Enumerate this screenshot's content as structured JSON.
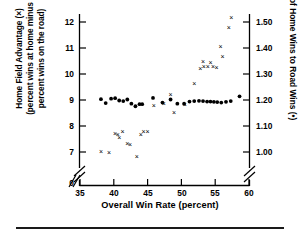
{
  "figure": {
    "background": "#ffffff",
    "ink": "#000000"
  },
  "axes": {
    "x": {
      "title": "Overall Win Rate (percent)",
      "ticks": [
        35,
        40,
        45,
        50,
        55,
        60
      ],
      "tick_labels": [
        "35",
        "40",
        "45",
        "50",
        "55",
        "60"
      ],
      "origin_label": "0",
      "range": [
        35,
        60
      ],
      "axis_break": true
    },
    "y_left": {
      "title_line1": "Home Field Advantage (×)",
      "title_line2": "(percent wins at home minus",
      "title_line3": "percent wins on the road)",
      "ticks": [
        7,
        8,
        9,
        10,
        11,
        12
      ],
      "tick_labels": [
        "7",
        "8",
        "9",
        "10",
        "11",
        "12"
      ],
      "origin_label": "0",
      "range": [
        7,
        12
      ],
      "axis_break": true,
      "marker": "x"
    },
    "y_right": {
      "title": "Ratio of Home Wins to Road Wins (•)",
      "ticks": [
        1.0,
        1.1,
        1.2,
        1.3,
        1.4,
        1.5
      ],
      "tick_labels": [
        "1.00",
        "1.10",
        "1.20",
        "1.30",
        "1.40",
        "1.50"
      ],
      "range": [
        1.0,
        1.5
      ],
      "axis_break": true,
      "marker": "•"
    }
  },
  "chart_data": {
    "type": "scatter",
    "title": "",
    "xlabel": "Overall Win Rate (percent)",
    "ylabel": "Home Field Advantage (x) (percent wins at home minus percent wins on the road)",
    "ylabel_right": "Ratio of Home Wins to Road Wins (•)",
    "xlim": [
      35,
      60
    ],
    "ylim_left": [
      7,
      12
    ],
    "ylim_right": [
      1.0,
      1.5
    ],
    "grid": false,
    "legend": "encoded in axis titles: x = Home Field Advantage, • = Ratio of Home Wins to Road Wins",
    "series": [
      {
        "name": "Home Field Advantage",
        "marker": "x",
        "axis": "left",
        "color": "#000000",
        "points": [
          {
            "x": 38.1,
            "y": 7.0
          },
          {
            "x": 39.3,
            "y": 6.96
          },
          {
            "x": 40.2,
            "y": 7.72
          },
          {
            "x": 40.6,
            "y": 7.66
          },
          {
            "x": 40.8,
            "y": 7.54
          },
          {
            "x": 41.3,
            "y": 7.8
          },
          {
            "x": 42.0,
            "y": 7.34
          },
          {
            "x": 42.4,
            "y": 7.28
          },
          {
            "x": 43.4,
            "y": 6.82
          },
          {
            "x": 44.0,
            "y": 7.68
          },
          {
            "x": 44.4,
            "y": 7.8
          },
          {
            "x": 45.0,
            "y": 7.78
          },
          {
            "x": 45.9,
            "y": 8.8
          },
          {
            "x": 47.4,
            "y": 8.85
          },
          {
            "x": 48.4,
            "y": 9.22
          },
          {
            "x": 48.9,
            "y": 8.52
          },
          {
            "x": 50.5,
            "y": 8.82
          },
          {
            "x": 51.9,
            "y": 9.64
          },
          {
            "x": 52.8,
            "y": 10.22
          },
          {
            "x": 53.2,
            "y": 10.48
          },
          {
            "x": 53.3,
            "y": 10.3
          },
          {
            "x": 53.9,
            "y": 10.28
          },
          {
            "x": 54.3,
            "y": 10.44
          },
          {
            "x": 54.7,
            "y": 10.3
          },
          {
            "x": 55.2,
            "y": 10.26
          },
          {
            "x": 55.8,
            "y": 11.06
          },
          {
            "x": 56.1,
            "y": 10.68
          },
          {
            "x": 57.0,
            "y": 11.78
          },
          {
            "x": 57.4,
            "y": 12.18
          }
        ]
      },
      {
        "name": "Ratio of Home Wins to Road Wins",
        "marker": "dot",
        "axis": "right",
        "color": "#000000",
        "points": [
          {
            "x": 38.1,
            "y": 1.203
          },
          {
            "x": 38.8,
            "y": 1.188
          },
          {
            "x": 39.6,
            "y": 1.205
          },
          {
            "x": 40.2,
            "y": 1.207
          },
          {
            "x": 40.8,
            "y": 1.198
          },
          {
            "x": 41.4,
            "y": 1.196
          },
          {
            "x": 42.0,
            "y": 1.202
          },
          {
            "x": 42.6,
            "y": 1.186
          },
          {
            "x": 43.2,
            "y": 1.176
          },
          {
            "x": 43.8,
            "y": 1.184
          },
          {
            "x": 44.2,
            "y": 1.184
          },
          {
            "x": 45.8,
            "y": 1.208
          },
          {
            "x": 47.2,
            "y": 1.19
          },
          {
            "x": 48.4,
            "y": 1.202
          },
          {
            "x": 49.4,
            "y": 1.186
          },
          {
            "x": 50.4,
            "y": 1.186
          },
          {
            "x": 51.2,
            "y": 1.194
          },
          {
            "x": 51.9,
            "y": 1.196
          },
          {
            "x": 52.6,
            "y": 1.197
          },
          {
            "x": 53.2,
            "y": 1.196
          },
          {
            "x": 53.8,
            "y": 1.194
          },
          {
            "x": 54.3,
            "y": 1.194
          },
          {
            "x": 54.8,
            "y": 1.193
          },
          {
            "x": 55.3,
            "y": 1.192
          },
          {
            "x": 55.9,
            "y": 1.19
          },
          {
            "x": 56.6,
            "y": 1.193
          },
          {
            "x": 57.3,
            "y": 1.196
          },
          {
            "x": 58.6,
            "y": 1.214
          }
        ]
      }
    ]
  }
}
